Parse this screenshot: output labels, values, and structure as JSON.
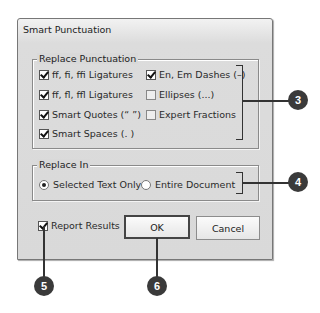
{
  "dialog": {
    "title": "Smart Punctuation",
    "replace_punctuation": {
      "legend": "Replace Punctuation",
      "options": [
        {
          "label": "ff, fi, ffi Ligatures",
          "checked": true
        },
        {
          "label": "ff, fl, ffl Ligatures",
          "checked": true
        },
        {
          "label": "Smart Quotes (“ ”)",
          "checked": true
        },
        {
          "label": "Smart Spaces (. )",
          "checked": true
        },
        {
          "label": "En, Em Dashes (–)",
          "checked": true
        },
        {
          "label": "Ellipses (...)",
          "checked": false
        },
        {
          "label": "Expert Fractions",
          "checked": false
        }
      ]
    },
    "replace_in": {
      "legend": "Replace In",
      "options": [
        {
          "label": "Selected Text Only",
          "selected": true
        },
        {
          "label": "Entire Document",
          "selected": false
        }
      ]
    },
    "report_results": {
      "label": "Report Results",
      "checked": true
    },
    "buttons": {
      "ok": "OK",
      "cancel": "Cancel"
    }
  },
  "callouts": [
    "3",
    "4",
    "5",
    "6"
  ]
}
